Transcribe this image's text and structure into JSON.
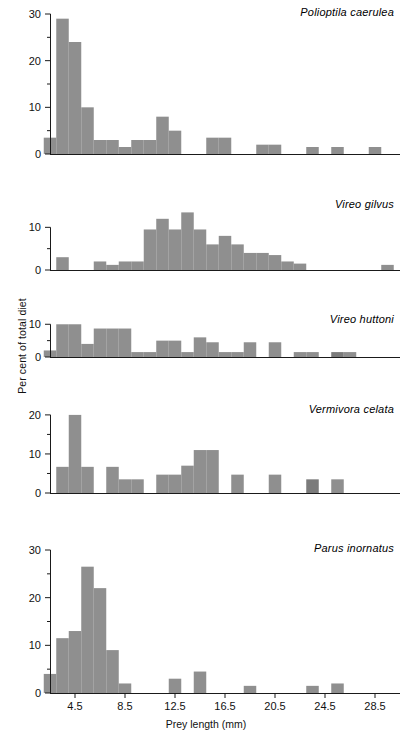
{
  "figure": {
    "xlabel": "Prey length (mm)",
    "ylabel": "Per cent of total diet",
    "bar_color": "#8f8f8f",
    "bar_color_dark": "#7b7b7b",
    "axis_color": "#1a1a1a"
  },
  "xaxis": {
    "ticks": [
      "4.5",
      "8.5",
      "12.5",
      "16.5",
      "20.5",
      "24.5",
      "28.5"
    ],
    "tick_values": [
      4.5,
      8.5,
      12.5,
      16.5,
      20.5,
      24.5,
      28.5
    ],
    "min": 2.5,
    "max": 30.5,
    "bin_width": 1
  },
  "chart_data": [
    {
      "type": "bar",
      "title": "Polioptila caerulea",
      "xlabel": "Prey length (mm)",
      "ylabel": "Per cent of total diet",
      "ylim": [
        0,
        30
      ],
      "yticks": [
        0,
        10,
        20,
        30
      ],
      "yminor": [
        5,
        15,
        25
      ],
      "xlim": [
        2.5,
        30.5
      ],
      "grid": false,
      "legend": "none",
      "x": [
        2.5,
        3.5,
        4.5,
        5.5,
        6.5,
        7.5,
        8.5,
        9.5,
        10.5,
        11.5,
        12.5,
        13.5,
        14.5,
        15.5,
        16.5,
        17.5,
        18.5,
        19.5,
        20.5,
        21.5,
        22.5,
        23.5,
        24.5,
        25.5,
        26.5,
        27.5,
        28.5,
        29.5
      ],
      "values": [
        3.5,
        29,
        24,
        10,
        3,
        3,
        1.5,
        3,
        3,
        8,
        5,
        0,
        0,
        3.5,
        3.5,
        0,
        0,
        2,
        2,
        0,
        0,
        1.5,
        0,
        1.5,
        0,
        0,
        1.5,
        0
      ]
    },
    {
      "type": "bar",
      "title": "Vireo gilvus",
      "xlabel": "Prey length (mm)",
      "ylabel": "Per cent of total diet",
      "ylim": [
        0,
        15
      ],
      "yticks": [
        0,
        10
      ],
      "yminor": [
        5
      ],
      "xlim": [
        2.5,
        30.5
      ],
      "grid": false,
      "legend": "none",
      "x": [
        2.5,
        3.5,
        4.5,
        5.5,
        6.5,
        7.5,
        8.5,
        9.5,
        10.5,
        11.5,
        12.5,
        13.5,
        14.5,
        15.5,
        16.5,
        17.5,
        18.5,
        19.5,
        20.5,
        21.5,
        22.5,
        23.5,
        24.5,
        25.5,
        26.5,
        27.5,
        28.5,
        29.5
      ],
      "values": [
        0,
        3,
        0,
        0,
        2,
        1.2,
        2,
        2,
        9.5,
        12,
        9.5,
        13.5,
        9.5,
        6,
        8,
        6,
        4,
        4,
        3.5,
        2,
        1.5,
        0,
        0,
        0,
        0,
        0,
        0,
        1.2
      ]
    },
    {
      "type": "bar",
      "title": "Vireo huttoni",
      "xlabel": "Prey length (mm)",
      "ylabel": "Per cent of total diet",
      "ylim": [
        0,
        11
      ],
      "yticks": [
        0,
        10
      ],
      "yminor": [
        5
      ],
      "xlim": [
        2.5,
        30.5
      ],
      "grid": false,
      "legend": "none",
      "x": [
        2.5,
        3.5,
        4.5,
        5.5,
        6.5,
        7.5,
        8.5,
        9.5,
        10.5,
        11.5,
        12.5,
        13.5,
        14.5,
        15.5,
        16.5,
        17.5,
        18.5,
        19.5,
        20.5,
        21.5,
        22.5,
        23.5,
        24.5,
        25.5,
        26.5,
        27.5,
        28.5,
        29.5
      ],
      "values": [
        2,
        10,
        10,
        4,
        8.7,
        8.7,
        8.7,
        1.5,
        1.5,
        5,
        5,
        1.5,
        6,
        4.5,
        1.5,
        1.5,
        4.5,
        0,
        4.5,
        0,
        1.5,
        1.5,
        0,
        1.5,
        1.5,
        0,
        0,
        0
      ]
    },
    {
      "type": "bar",
      "title": "Vermivora celata",
      "xlabel": "Prey length (mm)",
      "ylabel": "Per cent of total diet",
      "ylim": [
        0,
        21
      ],
      "yticks": [
        0,
        10,
        20
      ],
      "yminor": [
        5,
        15
      ],
      "xlim": [
        2.5,
        30.5
      ],
      "grid": false,
      "legend": "none",
      "x": [
        2.5,
        3.5,
        4.5,
        5.5,
        6.5,
        7.5,
        8.5,
        9.5,
        10.5,
        11.5,
        12.5,
        13.5,
        14.5,
        15.5,
        16.5,
        17.5,
        18.5,
        19.5,
        20.5,
        21.5,
        22.5,
        23.5,
        24.5,
        25.5,
        26.5,
        27.5,
        28.5,
        29.5
      ],
      "values": [
        0,
        6.7,
        20,
        6.7,
        0,
        6.7,
        3.5,
        3.5,
        0,
        4.7,
        4.7,
        7,
        11,
        11,
        0,
        4.7,
        0,
        0,
        4.7,
        0,
        0,
        3.5,
        0,
        3.5,
        0,
        0,
        0,
        0
      ]
    },
    {
      "type": "bar",
      "title": "Parus inornatus",
      "xlabel": "Prey length (mm)",
      "ylabel": "Per cent of total diet",
      "ylim": [
        0,
        30
      ],
      "yticks": [
        0,
        10,
        20,
        30
      ],
      "yminor": [
        5,
        15,
        25
      ],
      "xlim": [
        2.5,
        30.5
      ],
      "grid": false,
      "legend": "none",
      "x": [
        2.5,
        3.5,
        4.5,
        5.5,
        6.5,
        7.5,
        8.5,
        9.5,
        10.5,
        11.5,
        12.5,
        13.5,
        14.5,
        15.5,
        16.5,
        17.5,
        18.5,
        19.5,
        20.5,
        21.5,
        22.5,
        23.5,
        24.5,
        25.5,
        26.5,
        27.5,
        28.5,
        29.5
      ],
      "values": [
        4,
        11.5,
        13,
        26.5,
        22,
        9,
        2,
        0,
        0,
        0,
        3,
        0,
        4.5,
        0,
        0,
        0,
        1.5,
        0,
        0,
        0,
        0,
        1.5,
        0,
        2,
        0,
        0,
        0,
        0
      ]
    }
  ]
}
